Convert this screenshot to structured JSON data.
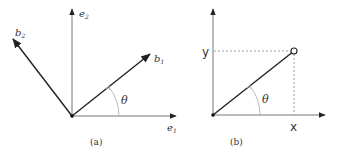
{
  "panel_a": {
    "caption": "(a)",
    "axes": {
      "e1_label": "e",
      "e1_sub": "1",
      "e2_label": "e",
      "e2_sub": "2"
    },
    "vectors": {
      "b1_label": "b",
      "b1_sub": "1",
      "b2_label": "b",
      "b2_sub": "2"
    },
    "angle_label": "θ"
  },
  "panel_b": {
    "caption": "(b)",
    "x_label": "x",
    "y_label": "y",
    "angle_label": "θ"
  },
  "colors": {
    "axis": "#777777",
    "vector": "#222222",
    "dashed": "#888888",
    "arc": "#aaaaaa",
    "text": "#333333"
  }
}
